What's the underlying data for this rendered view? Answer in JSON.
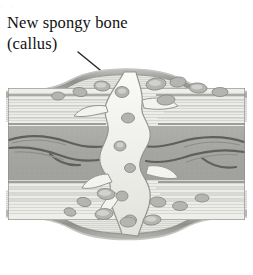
{
  "figure": {
    "kind": "anatomical-illustration",
    "top_remnant_text": "·                              ·",
    "label": {
      "line1": "New spongy bone",
      "line2": "(callus)"
    },
    "leader_line": {
      "from_x": 78,
      "from_y": 52,
      "to_x": 143,
      "to_y": 105,
      "color": "#2a2a2a",
      "width": 1.5
    },
    "frame": {
      "left": 6,
      "top": 62,
      "width": 241,
      "height": 196,
      "border_color": "#8e8e8e",
      "box_left": 2,
      "box_top": 26,
      "box_right": 239,
      "box_bottom": 132
    },
    "palette": {
      "background": "#ffffff",
      "text": "#111111",
      "periosteum": "#9a9a9a",
      "periosteum_dark": "#7c7c7c",
      "compact_bone": "#e9e9e6",
      "compact_bone_line": "#cfcfcb",
      "marrow": "#a8a8a8",
      "marrow_dark": "#6f6f6f",
      "callus": "#f2f2ee",
      "callus_shadow": "#b9b9b5",
      "callus_outline": "#909090",
      "vessel": "#5e5e5e",
      "trabecula_fill": "#b4b4b0"
    }
  }
}
